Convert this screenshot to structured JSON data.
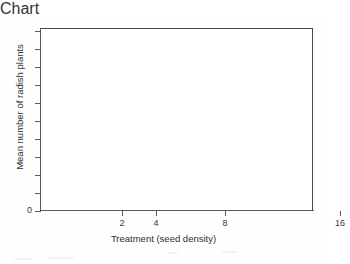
{
  "chart_data": {
    "type": "line",
    "title": "",
    "subtitle": "",
    "xlabel": "Treatment (seed density)",
    "ylabel": "Mean number of radish plants",
    "x_scale": "log2",
    "x_ticks": [
      {
        "value": 2,
        "label": "2",
        "pos_px": 82
      },
      {
        "value": 4,
        "label": "4",
        "pos_px": 116
      },
      {
        "value": 8,
        "label": "8",
        "pos_px": 185
      },
      {
        "value": 16,
        "label": "16",
        "pos_px": 300
      }
    ],
    "xlim": [
      1,
      18
    ],
    "ylim": [
      0,
      10
    ],
    "y_ticks": [
      {
        "label": "0",
        "pos_px": 183
      },
      {
        "label": "",
        "pos_px": 165
      },
      {
        "label": "",
        "pos_px": 147
      },
      {
        "label": "",
        "pos_px": 129
      },
      {
        "label": "",
        "pos_px": 111
      },
      {
        "label": "",
        "pos_px": 93
      },
      {
        "label": "",
        "pos_px": 75
      },
      {
        "label": "",
        "pos_px": 57
      },
      {
        "label": "",
        "pos_px": 39
      },
      {
        "label": "",
        "pos_px": 21
      },
      {
        "label": "",
        "pos_px": 3
      }
    ],
    "grid": false,
    "legend": null,
    "series": [],
    "values": [],
    "categories": [],
    "annotations": [],
    "note": "Blank axes template; no data plotted in the figure."
  },
  "figure": {
    "axis_color": "#4a4a4a",
    "spine_color": "#5a5a5a",
    "text_color": "#2f2f2f",
    "background": "#ffffff"
  }
}
